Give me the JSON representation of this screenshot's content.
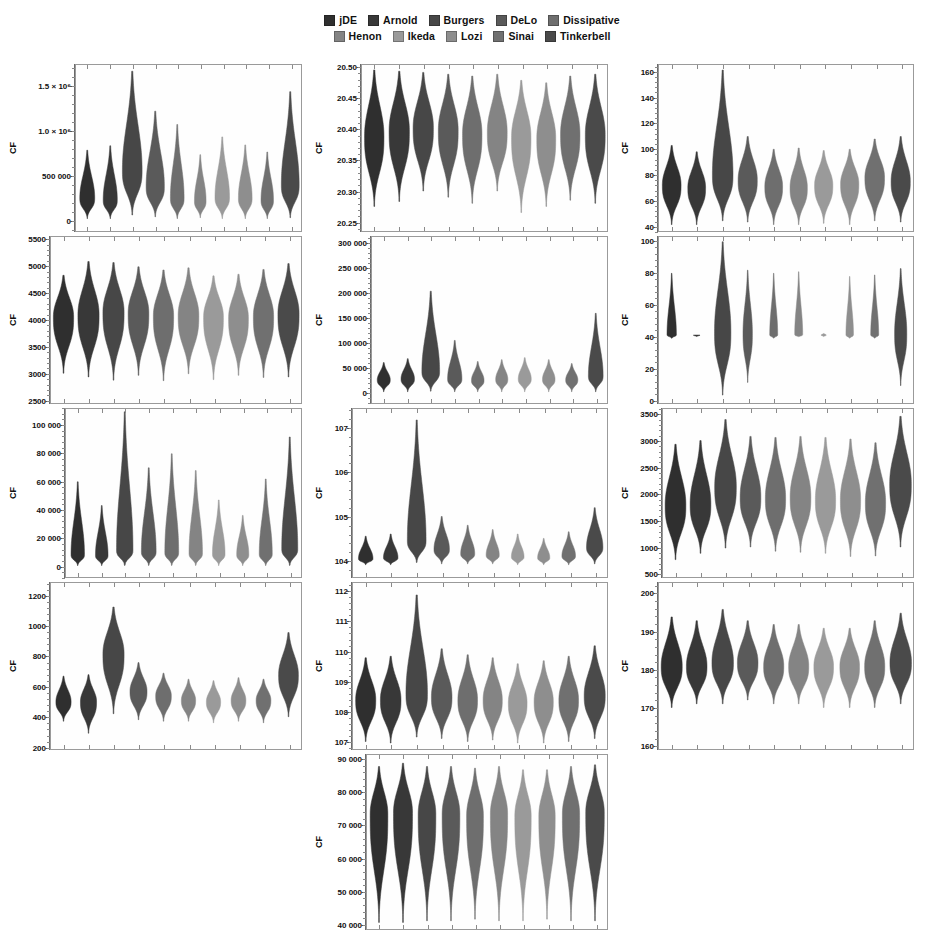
{
  "legend": {
    "rows": [
      [
        {
          "label": "jDE",
          "color": "#2f2f2f"
        },
        {
          "label": "Arnold",
          "color": "#383838"
        },
        {
          "label": "Burgers",
          "color": "#474747"
        },
        {
          "label": "DeLo",
          "color": "#5a5a5a"
        },
        {
          "label": "Dissipative",
          "color": "#6e6e6e"
        }
      ],
      [
        {
          "label": "Henon",
          "color": "#848484"
        },
        {
          "label": "Ikeda",
          "color": "#9a9a9a"
        },
        {
          "label": "Lozi",
          "color": "#8e8e8e"
        },
        {
          "label": "Sinai",
          "color": "#707070"
        },
        {
          "label": "Tinkerbell",
          "color": "#4a4a4a"
        }
      ]
    ]
  },
  "series_order": [
    "jDE",
    "Arnold",
    "Burgers",
    "DeLo",
    "Dissipative",
    "Henon",
    "Ikeda",
    "Lozi",
    "Sinai",
    "Tinkerbell"
  ],
  "series_colors": [
    "#2f2f2f",
    "#383838",
    "#474747",
    "#5a5a5a",
    "#6e6e6e",
    "#848484",
    "#9a9a9a",
    "#8e8e8e",
    "#707070",
    "#4a4a4a"
  ],
  "axis_label": "CF",
  "chart_data": [
    {
      "type": "violin",
      "panel_index": 1,
      "ylabel": "CF",
      "ylim": [
        -120000,
        1750000
      ],
      "yticks": [
        0,
        500000,
        1000000,
        1500000
      ],
      "ytick_labels": [
        "0",
        "500 000",
        "1.0 × 10⁶",
        "1.5 × 10⁶"
      ],
      "categories": [
        "jDE",
        "Arnold",
        "Burgers",
        "DeLo",
        "Dissipative",
        "Henon",
        "Ikeda",
        "Lozi",
        "Sinai",
        "Tinkerbell"
      ],
      "medians": [
        250000,
        230000,
        560000,
        380000,
        250000,
        220000,
        260000,
        250000,
        230000,
        400000
      ],
      "mins": [
        20000,
        20000,
        60000,
        40000,
        20000,
        30000,
        20000,
        20000,
        20000,
        30000
      ],
      "maxs": [
        790000,
        840000,
        1680000,
        1230000,
        1080000,
        740000,
        940000,
        850000,
        770000,
        1450000
      ],
      "widths": [
        0.72,
        0.68,
        0.95,
        0.88,
        0.66,
        0.56,
        0.7,
        0.66,
        0.6,
        0.86
      ]
    },
    {
      "type": "violin",
      "panel_index": 2,
      "ylabel": "CF",
      "ylim": [
        20.235,
        20.505
      ],
      "yticks": [
        20.25,
        20.3,
        20.35,
        20.4,
        20.45,
        20.5
      ],
      "ytick_labels": [
        "20.25",
        "20.30",
        "20.35",
        "20.40",
        "20.45",
        "20.50"
      ],
      "categories": [
        "jDE",
        "Arnold",
        "Burgers",
        "DeLo",
        "Dissipative",
        "Henon",
        "Ikeda",
        "Lozi",
        "Sinai",
        "Tinkerbell"
      ],
      "medians": [
        20.389,
        20.398,
        20.403,
        20.399,
        20.393,
        20.396,
        20.388,
        20.386,
        20.393,
        20.392
      ],
      "mins": [
        20.275,
        20.283,
        20.3,
        20.29,
        20.28,
        20.3,
        20.265,
        20.275,
        20.285,
        20.28
      ],
      "maxs": [
        20.497,
        20.495,
        20.493,
        20.49,
        20.487,
        20.49,
        20.48,
        20.476,
        20.487,
        20.49
      ],
      "widths": [
        0.86,
        0.9,
        0.9,
        0.88,
        0.86,
        0.88,
        0.86,
        0.84,
        0.86,
        0.88
      ]
    },
    {
      "type": "violin",
      "panel_index": 3,
      "ylabel": "CF",
      "ylim": [
        36,
        166
      ],
      "yticks": [
        40,
        60,
        80,
        100,
        120,
        140,
        160
      ],
      "ytick_labels": [
        "40",
        "60",
        "80",
        "100",
        "120",
        "140",
        "160"
      ],
      "categories": [
        "jDE",
        "Arnold",
        "Burgers",
        "DeLo",
        "Dissipative",
        "Henon",
        "Ikeda",
        "Lozi",
        "Sinai",
        "Tinkerbell"
      ],
      "medians": [
        72,
        70,
        80,
        76,
        71,
        70,
        72,
        73,
        78,
        75
      ],
      "mins": [
        41,
        41,
        44,
        43,
        41,
        41,
        42,
        41,
        44,
        43
      ],
      "maxs": [
        103,
        98,
        162,
        110,
        100,
        101,
        99,
        100,
        108,
        110
      ],
      "widths": [
        0.8,
        0.76,
        0.88,
        0.82,
        0.76,
        0.74,
        0.78,
        0.78,
        0.84,
        0.82
      ]
    },
    {
      "type": "violin",
      "panel_index": 4,
      "ylabel": "CF",
      "ylim": [
        2440,
        5560
      ],
      "yticks": [
        2500,
        3000,
        3500,
        4000,
        4500,
        5000,
        5500
      ],
      "ytick_labels": [
        "2500",
        "3000",
        "3500",
        "4000",
        "4500",
        "5000",
        "5500"
      ],
      "categories": [
        "jDE",
        "Arnold",
        "Burgers",
        "DeLo",
        "Dissipative",
        "Henon",
        "Ikeda",
        "Lozi",
        "Sinai",
        "Tinkerbell"
      ],
      "medians": [
        4060,
        4100,
        4150,
        4130,
        4080,
        4090,
        4060,
        4040,
        4070,
        4120
      ],
      "mins": [
        3000,
        2930,
        2870,
        2960,
        2860,
        2990,
        2880,
        2960,
        2920,
        2930
      ],
      "maxs": [
        4840,
        5100,
        5080,
        5000,
        4940,
        4980,
        4830,
        4860,
        4950,
        5060
      ],
      "widths": [
        0.88,
        0.92,
        0.92,
        0.9,
        0.88,
        0.9,
        0.86,
        0.86,
        0.88,
        0.92
      ]
    },
    {
      "type": "violin",
      "panel_index": 5,
      "ylabel": "CF",
      "ylim": [
        -22000,
        315000
      ],
      "yticks": [
        0,
        50000,
        100000,
        150000,
        200000,
        250000,
        300000
      ],
      "ytick_labels": [
        "0",
        "50 000",
        "100 000",
        "150 000",
        "200 000",
        "250 000",
        "300 000"
      ],
      "categories": [
        "jDE",
        "Arnold",
        "Burgers",
        "DeLo",
        "Dissipative",
        "Henon",
        "Ikeda",
        "Lozi",
        "Sinai",
        "Tinkerbell"
      ],
      "medians": [
        25000,
        27000,
        42000,
        27000,
        24000,
        26000,
        27000,
        26000,
        25000,
        33000
      ],
      "mins": [
        1000,
        1000,
        2000,
        1000,
        1000,
        1000,
        1000,
        1000,
        1000,
        1000
      ],
      "maxs": [
        60000,
        68000,
        205000,
        105000,
        62000,
        66000,
        70000,
        66000,
        58000,
        160000
      ],
      "widths": [
        0.6,
        0.62,
        0.82,
        0.66,
        0.58,
        0.56,
        0.6,
        0.58,
        0.56,
        0.68
      ]
    },
    {
      "type": "violin",
      "panel_index": 6,
      "ylabel": "CF",
      "ylim": [
        -2,
        103
      ],
      "yticks": [
        0,
        20,
        40,
        60,
        80,
        100
      ],
      "ytick_labels": [
        "0",
        "20",
        "40",
        "60",
        "80",
        "100"
      ],
      "categories": [
        "jDE",
        "Arnold",
        "Burgers",
        "DeLo",
        "Dissipative",
        "Henon",
        "Ikeda",
        "Lozi",
        "Sinai",
        "Tinkerbell"
      ],
      "medians": [
        41,
        41,
        43,
        42,
        41,
        41,
        41,
        41,
        41,
        42
      ],
      "mins": [
        39,
        40,
        3,
        11,
        39,
        40,
        40,
        39,
        39,
        9
      ],
      "maxs": [
        80,
        41,
        100,
        82,
        80,
        81,
        42,
        78,
        79,
        83
      ],
      "widths": [
        0.4,
        0.28,
        0.7,
        0.4,
        0.34,
        0.34,
        0.22,
        0.32,
        0.34,
        0.52
      ]
    },
    {
      "type": "violin",
      "panel_index": 7,
      "ylabel": "CF",
      "ylim": [
        -8000,
        112000
      ],
      "yticks": [
        0,
        20000,
        40000,
        60000,
        80000,
        100000
      ],
      "ytick_labels": [
        "0",
        "20 000",
        "40 000",
        "60 000",
        "80 000",
        "100 000"
      ],
      "categories": [
        "jDE",
        "Arnold",
        "Burgers",
        "DeLo",
        "Dissipative",
        "Henon",
        "Ikeda",
        "Lozi",
        "Sinai",
        "Tinkerbell"
      ],
      "medians": [
        8000,
        7500,
        11000,
        10000,
        9500,
        9000,
        8500,
        8000,
        8500,
        12000
      ],
      "mins": [
        200,
        200,
        300,
        300,
        300,
        300,
        200,
        200,
        200,
        300
      ],
      "maxs": [
        60000,
        43000,
        110000,
        70000,
        80000,
        68000,
        47000,
        36000,
        62000,
        92000
      ],
      "widths": [
        0.62,
        0.58,
        0.76,
        0.68,
        0.64,
        0.62,
        0.58,
        0.56,
        0.6,
        0.74
      ]
    },
    {
      "type": "violin",
      "panel_index": 8,
      "ylabel": "CF",
      "ylim": [
        103.62,
        107.45
      ],
      "yticks": [
        104,
        105,
        106,
        107
      ],
      "ytick_labels": [
        "104",
        "105",
        "106",
        "107"
      ],
      "categories": [
        "jDE",
        "Arnold",
        "Burgers",
        "DeLo",
        "Dissipative",
        "Henon",
        "Ikeda",
        "Lozi",
        "Sinai",
        "Tinkerbell"
      ],
      "medians": [
        104.04,
        104.06,
        104.45,
        104.25,
        104.15,
        104.12,
        104.08,
        104.06,
        104.1,
        104.3
      ],
      "mins": [
        103.9,
        103.9,
        103.95,
        103.92,
        103.92,
        103.92,
        103.9,
        103.9,
        103.9,
        103.92
      ],
      "maxs": [
        104.55,
        104.6,
        107.2,
        105.0,
        104.8,
        104.7,
        104.6,
        104.5,
        104.65,
        105.2
      ],
      "widths": [
        0.62,
        0.62,
        0.8,
        0.66,
        0.6,
        0.56,
        0.54,
        0.52,
        0.58,
        0.7
      ]
    },
    {
      "type": "violin",
      "panel_index": 9,
      "ylabel": "CF",
      "ylim": [
        430,
        3620
      ],
      "yticks": [
        500,
        1000,
        1500,
        2000,
        2500,
        3000,
        3500
      ],
      "ytick_labels": [
        "500",
        "1000",
        "1500",
        "2000",
        "2500",
        "3000",
        "3500"
      ],
      "categories": [
        "jDE",
        "Arnold",
        "Burgers",
        "DeLo",
        "Dissipative",
        "Henon",
        "Ikeda",
        "Lozi",
        "Sinai",
        "Tinkerbell"
      ],
      "medians": [
        1800,
        1820,
        2150,
        1950,
        1930,
        1950,
        1900,
        1900,
        1850,
        2200
      ],
      "mins": [
        760,
        880,
        980,
        1000,
        920,
        900,
        880,
        820,
        830,
        1000
      ],
      "maxs": [
        2950,
        3020,
        3420,
        3100,
        3080,
        3100,
        3080,
        3050,
        2980,
        3480
      ],
      "widths": [
        0.9,
        0.9,
        0.94,
        0.9,
        0.88,
        0.9,
        0.88,
        0.88,
        0.88,
        0.94
      ]
    },
    {
      "type": "violin",
      "panel_index": 10,
      "ylabel": "CF",
      "ylim": [
        185,
        1290
      ],
      "yticks": [
        200,
        400,
        600,
        800,
        1000,
        1200
      ],
      "ytick_labels": [
        "200",
        "400",
        "600",
        "800",
        "1000",
        "1200"
      ],
      "categories": [
        "jDE",
        "Arnold",
        "Burgers",
        "DeLo",
        "Dissipative",
        "Henon",
        "Ikeda",
        "Lozi",
        "Sinai",
        "Tinkerbell"
      ],
      "medians": [
        500,
        500,
        820,
        570,
        540,
        510,
        500,
        510,
        510,
        680
      ],
      "mins": [
        370,
        290,
        420,
        380,
        370,
        370,
        360,
        370,
        360,
        400
      ],
      "maxs": [
        670,
        680,
        1130,
        760,
        690,
        650,
        640,
        660,
        650,
        960
      ],
      "widths": [
        0.66,
        0.7,
        0.92,
        0.74,
        0.68,
        0.62,
        0.62,
        0.64,
        0.64,
        0.86
      ]
    },
    {
      "type": "violin",
      "panel_index": 11,
      "ylabel": "CF",
      "ylim": [
        106.75,
        112.3
      ],
      "yticks": [
        107,
        108,
        109,
        110,
        111,
        112
      ],
      "ytick_labels": [
        "107",
        "108",
        "109",
        "110",
        "111",
        "112"
      ],
      "categories": [
        "jDE",
        "Arnold",
        "Burgers",
        "DeLo",
        "Dissipative",
        "Henon",
        "Ikeda",
        "Lozi",
        "Sinai",
        "Tinkerbell"
      ],
      "medians": [
        108.4,
        108.4,
        108.6,
        108.5,
        108.4,
        108.4,
        108.3,
        108.35,
        108.4,
        108.55
      ],
      "mins": [
        107.0,
        106.95,
        107.15,
        107.1,
        107.0,
        107.05,
        106.95,
        106.95,
        107.0,
        107.1
      ],
      "maxs": [
        109.8,
        109.85,
        111.9,
        110.1,
        109.9,
        109.8,
        109.6,
        109.7,
        109.85,
        110.2
      ],
      "widths": [
        0.86,
        0.88,
        0.92,
        0.88,
        0.84,
        0.82,
        0.8,
        0.82,
        0.84,
        0.9
      ]
    },
    {
      "type": "violin",
      "panel_index": 12,
      "ylabel": "CF",
      "ylim": [
        159,
        203
      ],
      "yticks": [
        160,
        170,
        180,
        190,
        200
      ],
      "ytick_labels": [
        "160",
        "170",
        "180",
        "190",
        "200"
      ],
      "categories": [
        "jDE",
        "Arnold",
        "Burgers",
        "DeLo",
        "Dissipative",
        "Henon",
        "Ikeda",
        "Lozi",
        "Sinai",
        "Tinkerbell"
      ],
      "medians": [
        181,
        181,
        182,
        182,
        181,
        181,
        181,
        181,
        181,
        182
      ],
      "mins": [
        170,
        171,
        171,
        172,
        171,
        171,
        170,
        170,
        170,
        171
      ],
      "maxs": [
        194,
        193,
        196,
        193,
        192,
        192,
        191,
        191,
        193,
        195
      ],
      "widths": [
        0.9,
        0.88,
        0.92,
        0.88,
        0.86,
        0.86,
        0.84,
        0.84,
        0.86,
        0.92
      ]
    },
    {
      "type": "violin",
      "panel_index": 13,
      "ylabel": "CF",
      "ylim": [
        38500,
        91500
      ],
      "yticks": [
        40000,
        50000,
        60000,
        70000,
        80000,
        90000
      ],
      "ytick_labels": [
        "40 000",
        "50 000",
        "60 000",
        "70 000",
        "80 000",
        "90 000"
      ],
      "categories": [
        "jDE",
        "Arnold",
        "Burgers",
        "DeLo",
        "Dissipative",
        "Henon",
        "Ikeda",
        "Lozi",
        "Sinai",
        "Tinkerbell"
      ],
      "medians": [
        73500,
        74000,
        73500,
        73500,
        73000,
        73500,
        73000,
        73000,
        73500,
        74000
      ],
      "mins": [
        40500,
        40500,
        41000,
        41000,
        41500,
        41000,
        41000,
        41500,
        41000,
        41000
      ],
      "maxs": [
        88000,
        89000,
        88000,
        88000,
        87500,
        88000,
        87000,
        87000,
        88000,
        88500
      ],
      "widths": [
        0.8,
        0.86,
        0.8,
        0.8,
        0.76,
        0.78,
        0.74,
        0.74,
        0.78,
        0.84
      ]
    }
  ]
}
